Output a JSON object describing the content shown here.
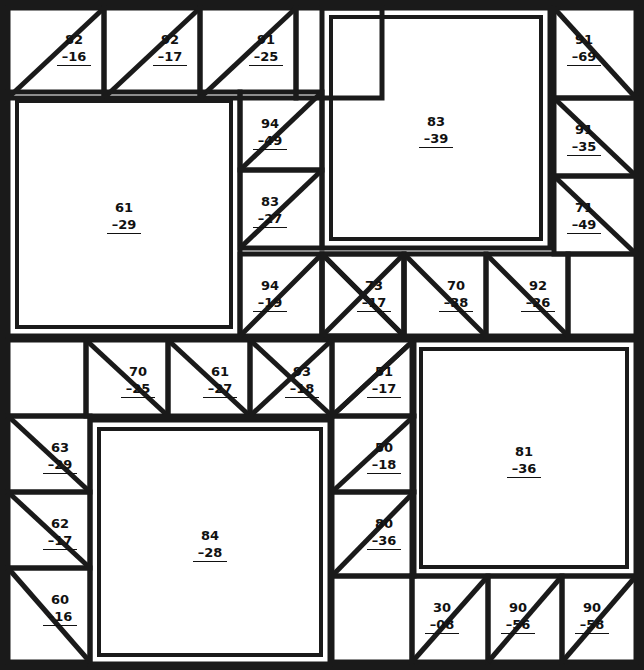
{
  "diagram": {
    "type": "patchwork-block-layout",
    "canvas": {
      "width": 644,
      "height": 670
    },
    "style": {
      "line_color": "#1a1a1a",
      "background_color": "#ffffff",
      "text_color": "#111111",
      "outer_border_width": 6,
      "seam_width": 5,
      "thin_seam_width": 4
    },
    "label_format": "code over dash-prefixed sub-code with underline rule",
    "pieces": [
      {
        "id": "p01",
        "code": "82",
        "sub": "–16",
        "x": 8,
        "y": 8,
        "w": 96,
        "h": 90,
        "shape": "half-square-triangle",
        "diagonal": "bl-tr",
        "label_pos": "upper-right"
      },
      {
        "id": "p02",
        "code": "92",
        "sub": "–17",
        "x": 104,
        "y": 8,
        "w": 96,
        "h": 90,
        "shape": "half-square-triangle",
        "diagonal": "bl-tr",
        "label_pos": "upper-right"
      },
      {
        "id": "p03",
        "code": "91",
        "sub": "–25",
        "x": 200,
        "y": 8,
        "w": 96,
        "h": 90,
        "shape": "half-square-triangle",
        "diagonal": "bl-tr",
        "label_pos": "upper-right"
      },
      {
        "id": "p04",
        "code": "",
        "sub": "",
        "x": 296,
        "y": 8,
        "w": 86,
        "h": 90,
        "shape": "plain",
        "diagonal": "none",
        "label_pos": "center"
      },
      {
        "id": "p05",
        "code": "91",
        "sub": "–69",
        "x": 554,
        "y": 8,
        "w": 82,
        "h": 90,
        "shape": "half-square-triangle",
        "diagonal": "tl-br",
        "label_pos": "upper-left"
      },
      {
        "id": "p06",
        "code": "83",
        "sub": "–39",
        "x": 322,
        "y": 8,
        "w": 228,
        "h": 240,
        "shape": "plain-double-border",
        "diagonal": "none",
        "label_pos": "center"
      },
      {
        "id": "p07",
        "code": "94",
        "sub": "–49",
        "x": 240,
        "y": 92,
        "w": 82,
        "h": 78,
        "shape": "half-square-triangle",
        "diagonal": "bl-tr",
        "label_pos": "upper-left"
      },
      {
        "id": "p08",
        "code": "91",
        "sub": "–35",
        "x": 554,
        "y": 98,
        "w": 82,
        "h": 78,
        "shape": "half-square-triangle",
        "diagonal": "tl-br",
        "label_pos": "upper-left"
      },
      {
        "id": "p09",
        "code": "61",
        "sub": "–29",
        "x": 8,
        "y": 92,
        "w": 232,
        "h": 244,
        "shape": "plain-double-border",
        "diagonal": "none",
        "label_pos": "center"
      },
      {
        "id": "p10",
        "code": "83",
        "sub": "–27",
        "x": 240,
        "y": 170,
        "w": 82,
        "h": 78,
        "shape": "half-square-triangle",
        "diagonal": "bl-tr",
        "label_pos": "upper-left"
      },
      {
        "id": "p11",
        "code": "71",
        "sub": "–49",
        "x": 554,
        "y": 176,
        "w": 82,
        "h": 78,
        "shape": "half-square-triangle",
        "diagonal": "tl-br",
        "label_pos": "upper-left"
      },
      {
        "id": "p12",
        "code": "94",
        "sub": "–19",
        "x": 240,
        "y": 254,
        "w": 82,
        "h": 82,
        "shape": "half-square-triangle",
        "diagonal": "bl-tr",
        "label_pos": "upper-left"
      },
      {
        "id": "p13",
        "code": "",
        "sub": "",
        "x": 322,
        "y": 254,
        "w": 82,
        "h": 82,
        "shape": "half-square-triangle",
        "diagonal": "tl-br",
        "label_pos": "center"
      },
      {
        "id": "p14",
        "code": "73",
        "sub": "–17",
        "x": 322,
        "y": 254,
        "w": 82,
        "h": 82,
        "shape": "half-square-triangle-overlay",
        "diagonal": "tl-br",
        "label_pos": "upper-right"
      },
      {
        "id": "p15",
        "code": "70",
        "sub": "–38",
        "x": 404,
        "y": 254,
        "w": 82,
        "h": 82,
        "shape": "half-square-triangle",
        "diagonal": "tl-br",
        "label_pos": "upper-right"
      },
      {
        "id": "p16",
        "code": "92",
        "sub": "–26",
        "x": 486,
        "y": 254,
        "w": 82,
        "h": 82,
        "shape": "half-square-triangle",
        "diagonal": "tl-br",
        "label_pos": "upper-right"
      },
      {
        "id": "p17",
        "code": "",
        "sub": "",
        "x": 568,
        "y": 254,
        "w": 68,
        "h": 82,
        "shape": "plain",
        "diagonal": "none",
        "label_pos": "center"
      },
      {
        "id": "p18",
        "code": "",
        "sub": "",
        "x": 8,
        "y": 340,
        "w": 78,
        "h": 76,
        "shape": "plain",
        "diagonal": "none",
        "label_pos": "center"
      },
      {
        "id": "p19",
        "code": "70",
        "sub": "–25",
        "x": 86,
        "y": 340,
        "w": 82,
        "h": 76,
        "shape": "half-square-triangle",
        "diagonal": "tl-br",
        "label_pos": "upper-right"
      },
      {
        "id": "p20",
        "code": "61",
        "sub": "–27",
        "x": 168,
        "y": 340,
        "w": 82,
        "h": 76,
        "shape": "half-square-triangle",
        "diagonal": "tl-br",
        "label_pos": "upper-right"
      },
      {
        "id": "p21",
        "code": "93",
        "sub": "–18",
        "x": 250,
        "y": 340,
        "w": 82,
        "h": 76,
        "shape": "half-square-triangle",
        "diagonal": "tl-br",
        "label_pos": "upper-right"
      },
      {
        "id": "p22",
        "code": "51",
        "sub": "–17",
        "x": 332,
        "y": 340,
        "w": 82,
        "h": 76,
        "shape": "half-square-triangle",
        "diagonal": "bl-tr",
        "label_pos": "upper-right"
      },
      {
        "id": "p23",
        "code": "81",
        "sub": "–36",
        "x": 412,
        "y": 340,
        "w": 224,
        "h": 236,
        "shape": "plain-double-border",
        "diagonal": "none",
        "label_pos": "center"
      },
      {
        "id": "p24",
        "code": "63",
        "sub": "–29",
        "x": 8,
        "y": 416,
        "w": 82,
        "h": 76,
        "shape": "half-square-triangle",
        "diagonal": "tl-br",
        "label_pos": "upper-right"
      },
      {
        "id": "p25",
        "code": "50",
        "sub": "–18",
        "x": 332,
        "y": 416,
        "w": 82,
        "h": 76,
        "shape": "half-square-triangle",
        "diagonal": "bl-tr",
        "label_pos": "upper-right"
      },
      {
        "id": "p26",
        "code": "84",
        "sub": "–28",
        "x": 90,
        "y": 420,
        "w": 240,
        "h": 244,
        "shape": "plain-double-border",
        "diagonal": "none",
        "label_pos": "center"
      },
      {
        "id": "p27",
        "code": "62",
        "sub": "–17",
        "x": 8,
        "y": 492,
        "w": 82,
        "h": 76,
        "shape": "half-square-triangle",
        "diagonal": "tl-br",
        "label_pos": "upper-right"
      },
      {
        "id": "p28",
        "code": "80",
        "sub": "–36",
        "x": 332,
        "y": 492,
        "w": 82,
        "h": 84,
        "shape": "half-square-triangle",
        "diagonal": "bl-tr",
        "label_pos": "upper-right"
      },
      {
        "id": "p29",
        "code": "60",
        "sub": "–16",
        "x": 8,
        "y": 568,
        "w": 82,
        "h": 94,
        "shape": "half-square-triangle",
        "diagonal": "tl-br",
        "label_pos": "upper-right"
      },
      {
        "id": "p30",
        "code": "",
        "sub": "",
        "x": 332,
        "y": 576,
        "w": 80,
        "h": 86,
        "shape": "plain",
        "diagonal": "none",
        "label_pos": "center"
      },
      {
        "id": "p31",
        "code": "30",
        "sub": "–08",
        "x": 412,
        "y": 576,
        "w": 76,
        "h": 86,
        "shape": "half-square-triangle",
        "diagonal": "bl-tr",
        "label_pos": "upper-left"
      },
      {
        "id": "p32",
        "code": "90",
        "sub": "–56",
        "x": 488,
        "y": 576,
        "w": 74,
        "h": 86,
        "shape": "half-square-triangle",
        "diagonal": "bl-tr",
        "label_pos": "upper-left"
      },
      {
        "id": "p33",
        "code": "90",
        "sub": "–58",
        "x": 562,
        "y": 576,
        "w": 74,
        "h": 86,
        "shape": "half-square-triangle",
        "diagonal": "bl-tr",
        "label_pos": "upper-left"
      }
    ],
    "extra_seams": [
      {
        "id": "s1",
        "x1": 322,
        "y1": 336,
        "x2": 404,
        "y2": 254,
        "note": "center star diagonal up-right"
      },
      {
        "id": "s2",
        "x1": 250,
        "y1": 416,
        "x2": 332,
        "y2": 340,
        "note": "lower star diagonal"
      },
      {
        "id": "s3",
        "x1": 332,
        "y1": 416,
        "x2": 414,
        "y2": 340,
        "note": "lower star diagonal right"
      }
    ],
    "codes_summary": [
      "82",
      "92",
      "91",
      "91",
      "83",
      "94",
      "91",
      "61",
      "83",
      "71",
      "94",
      "73",
      "70",
      "92",
      "70",
      "61",
      "93",
      "51",
      "81",
      "63",
      "50",
      "84",
      "62",
      "80",
      "60",
      "30",
      "90",
      "90"
    ],
    "subs_summary": [
      "–16",
      "–17",
      "–25",
      "–69",
      "–39",
      "–49",
      "–35",
      "–29",
      "–27",
      "–49",
      "–19",
      "–17",
      "–38",
      "–26",
      "–25",
      "–27",
      "–18",
      "–17",
      "–36",
      "–29",
      "–18",
      "–28",
      "–17",
      "–36",
      "–16",
      "–08",
      "–56",
      "–58"
    ]
  }
}
